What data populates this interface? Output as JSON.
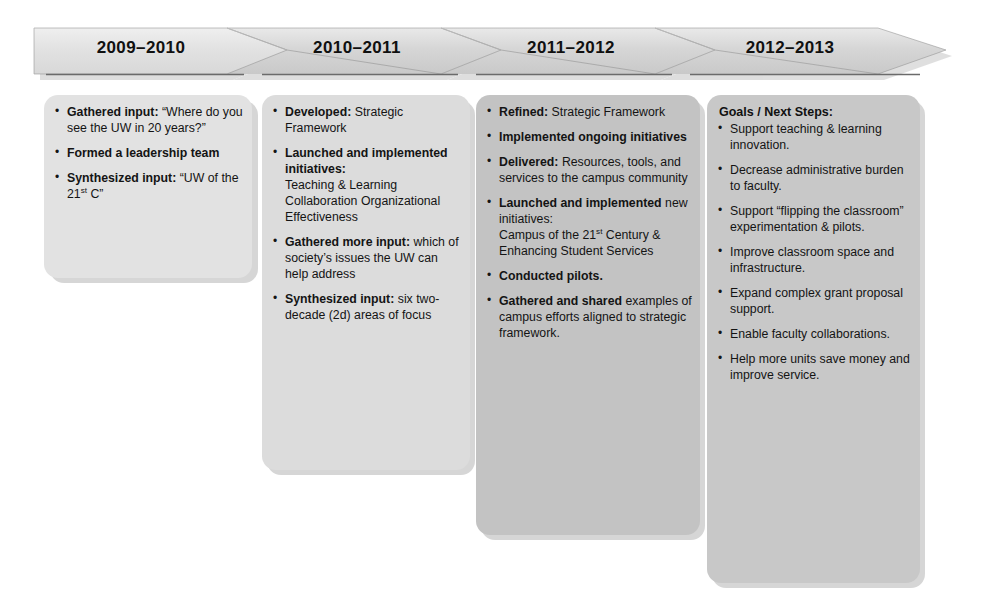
{
  "diagram": {
    "type": "chevron-timeline",
    "colors": {
      "arrow_fill": "#cfcfcf",
      "arrow_fill_light": "#e4e4e4",
      "card_light": "#e2e2e2",
      "card_dark": "#c3c3c3",
      "rule_line": "#6b6b6b",
      "text": "#141414"
    }
  },
  "phases": [
    {
      "year_label": "2009–2010",
      "heading": null,
      "items": [
        {
          "lead": "Gathered input:",
          "tail": " “Where do you see the UW in 20 years?”"
        },
        {
          "lead": "Formed a leadership team",
          "tail": ""
        },
        {
          "lead": "Synthesized input:",
          "tail": " “UW of the 21",
          "sup": "st",
          "tail2": " C”"
        }
      ]
    },
    {
      "year_label": "2010–2011",
      "heading": null,
      "items": [
        {
          "lead": "Developed:",
          "tail": " Strategic Framework"
        },
        {
          "lead": "Launched and implemented initiatives:",
          "tail": "",
          "sub": "Teaching & Learning Collaboration Organizational Effectiveness"
        },
        {
          "lead": "Gathered more input:",
          "tail": " which of society’s issues the UW can help address"
        },
        {
          "lead": "Synthesized input:",
          "tail": " six two-decade (2d) areas of focus"
        }
      ]
    },
    {
      "year_label": "2011–2012",
      "heading": null,
      "items": [
        {
          "lead": "Refined:",
          "tail": " Strategic Framework"
        },
        {
          "lead": "Implemented ongoing initiatives",
          "tail": ""
        },
        {
          "lead": "Delivered:",
          "tail": " Resources, tools, and services to the campus community"
        },
        {
          "lead": "Launched and implemented",
          "tail": " new initiatives:",
          "sub": "Campus of the 21",
          "sup": "st",
          "sub2": " Century & Enhancing Student Services"
        },
        {
          "lead": "Conducted pilots.",
          "tail": ""
        },
        {
          "lead": "Gathered and shared",
          "tail": " examples of campus efforts aligned to strategic framework."
        }
      ]
    },
    {
      "year_label": "2012–2013",
      "heading": "Goals / Next Steps:",
      "items": [
        {
          "lead": "",
          "tail": "Support teaching & learning innovation."
        },
        {
          "lead": "",
          "tail": "Decrease administrative burden to faculty."
        },
        {
          "lead": "",
          "tail": "Support “flipping the classroom” experimentation & pilots."
        },
        {
          "lead": "",
          "tail": "Improve classroom space and infrastructure."
        },
        {
          "lead": "",
          "tail": "Expand complex grant proposal support."
        },
        {
          "lead": "",
          "tail": "Enable faculty collaborations."
        },
        {
          "lead": "",
          "tail": "Help more units save money and improve service."
        }
      ]
    }
  ]
}
